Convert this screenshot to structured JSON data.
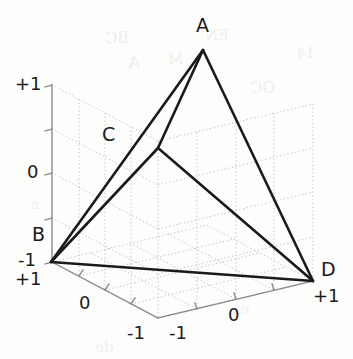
{
  "figure": {
    "kind": "matlab-3d-line-plot",
    "title": "",
    "background_color": "#fdfdfc",
    "edge_color": "#1a1a1a",
    "grid_color": "#b9b9b9",
    "axis_color": "#8c8c8c",
    "text_color": "#1b1b1b"
  },
  "chart_data": {
    "type": "line",
    "title": "",
    "subtitle": "",
    "xlabel": "",
    "ylabel": "",
    "zlabel": "",
    "xlim": [
      -1,
      1
    ],
    "ylim": [
      -1,
      1
    ],
    "zlim": [
      -1,
      1
    ],
    "grid": true,
    "legend": null,
    "projection": "3d",
    "shape": "tetrahedron",
    "vertices": [
      {
        "name": "A",
        "xyz": [
          0,
          0,
          1
        ],
        "px": [
          203,
          50
        ],
        "label_px": [
          196,
          18
        ]
      },
      {
        "name": "B",
        "xyz": [
          1,
          1,
          -1
        ],
        "px": [
          51,
          262
        ],
        "label_px": [
          33,
          227
        ]
      },
      {
        "name": "C",
        "xyz": [
          -1,
          1,
          0
        ],
        "px": [
          158,
          148
        ],
        "label_px": [
          103,
          127
        ]
      },
      {
        "name": "D",
        "xyz": [
          1,
          -1,
          -1
        ],
        "px": [
          313,
          281
        ],
        "label_px": [
          322,
          262
        ]
      }
    ],
    "edges": [
      {
        "from": "A",
        "to": "B"
      },
      {
        "from": "A",
        "to": "C"
      },
      {
        "from": "A",
        "to": "D"
      },
      {
        "from": "B",
        "to": "C"
      },
      {
        "from": "B",
        "to": "D"
      },
      {
        "from": "C",
        "to": "D"
      }
    ],
    "axes": [
      {
        "name": "z-axis",
        "orientation": "vertical-left",
        "from_px": [
          52,
          85
        ],
        "to_px": [
          52,
          262
        ],
        "ticks": [
          {
            "label": "+1",
            "px": [
              52,
              85
            ],
            "text_px": [
              17,
              76
            ]
          },
          {
            "label": "",
            "px": [
              52,
              129
            ]
          },
          {
            "label": "0",
            "px": [
              52,
              173
            ],
            "text_px": [
              28,
              164
            ]
          },
          {
            "label": "",
            "px": [
              52,
              218
            ]
          },
          {
            "label": "-1",
            "px": [
              52,
              262
            ],
            "text_px": [
              19,
              253
            ]
          }
        ]
      },
      {
        "name": "y-axis",
        "orientation": "bottom-left-diagonal",
        "from_px": [
          52,
          262
        ],
        "to_px": [
          158,
          318
        ],
        "ticks": [
          {
            "label": "+1",
            "px": [
              52,
              262
            ],
            "text_px": [
              17,
              272
            ]
          },
          {
            "label": "",
            "px": [
              79,
              276
            ]
          },
          {
            "label": "0",
            "px": [
              105,
              290
            ],
            "text_px": [
              80,
              297
            ]
          },
          {
            "label": "",
            "px": [
              131,
              304
            ]
          },
          {
            "label": "-1",
            "px": [
              158,
              318
            ],
            "text_px": [
              129,
              327
            ]
          }
        ]
      },
      {
        "name": "x-axis",
        "orientation": "bottom-right-diagonal",
        "from_px": [
          158,
          318
        ],
        "to_px": [
          313,
          281
        ],
        "ticks": [
          {
            "label": "-1",
            "px": [
              158,
              318
            ],
            "text_px": [
              170,
              327
            ]
          },
          {
            "label": "",
            "px": [
              197,
              309
            ]
          },
          {
            "label": "0",
            "px": [
              236,
              299
            ],
            "text_px": [
              229,
              309
            ]
          },
          {
            "label": "",
            "px": [
              274,
              290
            ]
          },
          {
            "label": "+1",
            "px": [
              313,
              281
            ],
            "text_px": [
              315,
              290
            ]
          }
        ]
      }
    ]
  },
  "vertex_labels": {
    "a": "A",
    "b": "B",
    "c": "C",
    "d": "D"
  },
  "tick_labels": {
    "z_top": "+1",
    "z_mid": "0",
    "z_bottom": "-1",
    "y_near": "+1",
    "y_mid": "0",
    "y_far": "-1",
    "x_near": "-1",
    "x_mid": "0",
    "x_far": "+1"
  },
  "background_bleed": [
    {
      "text": "BC",
      "px": [
        105,
        28
      ],
      "size": 16,
      "rot": -2
    },
    {
      "text": "EN",
      "px": [
        205,
        26
      ],
      "size": 15,
      "rot": -2
    },
    {
      "text": "A",
      "px": [
        128,
        52
      ],
      "size": 17,
      "rot": -2
    },
    {
      "text": "M",
      "px": [
        168,
        50
      ],
      "size": 15,
      "rot": -2
    },
    {
      "text": "OC",
      "px": [
        250,
        78
      ],
      "size": 16,
      "rot": -2
    },
    {
      "text": "14",
      "px": [
        296,
        44
      ],
      "size": 15,
      "rot": -2
    },
    {
      "text": "ex",
      "px": [
        232,
        300
      ],
      "size": 15,
      "rot": -2
    },
    {
      "text": "de",
      "px": [
        95,
        338
      ],
      "size": 15,
      "rot": -2
    },
    {
      "text": "n",
      "px": [
        30,
        196
      ],
      "size": 14,
      "rot": -2
    }
  ]
}
